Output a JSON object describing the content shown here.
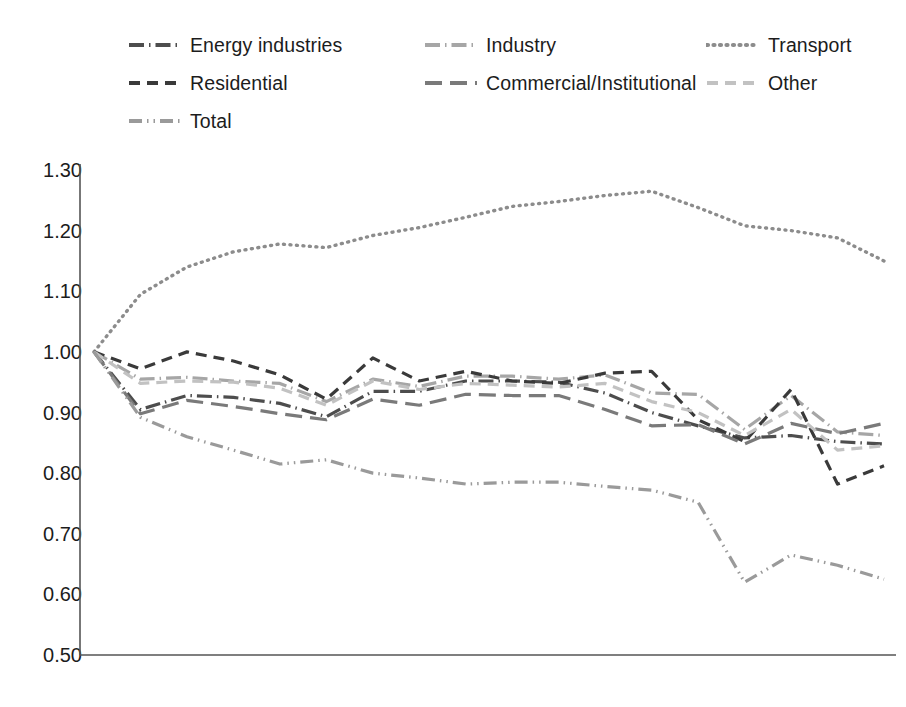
{
  "chart_data": {
    "type": "line",
    "title": "",
    "subtitle": "",
    "xlabel": "",
    "ylabel": "",
    "ylim": [
      0.5,
      1.3
    ],
    "ytick_step": 0.1,
    "ytick_labels": [
      "1.30",
      "1.20",
      "1.10",
      "1.00",
      "0.90",
      "0.80",
      "0.70",
      "0.60",
      "0.50"
    ],
    "ytick_values": [
      1.3,
      1.2,
      1.1,
      1.0,
      0.9,
      0.8,
      0.7,
      0.6,
      0.5
    ],
    "grid": false,
    "legend_position": "top",
    "categories": [
      "1990",
      "1995",
      "1997",
      "1998",
      "1999",
      "2000",
      "2001",
      "2002",
      "2003",
      "2004",
      "2005",
      "2006",
      "2007",
      "2008",
      "2009",
      "2010",
      "2011",
      "2012"
    ],
    "series": [
      {
        "name": "Energy industries",
        "color": "#4d4d4d",
        "dash": "dashdot",
        "values": [
          1.0,
          0.905,
          0.928,
          0.925,
          0.915,
          0.893,
          0.935,
          0.935,
          0.952,
          0.952,
          0.95,
          0.932,
          0.9,
          0.878,
          0.858,
          0.862,
          0.852,
          0.848
        ]
      },
      {
        "name": "Industry",
        "color": "#a6a6a6",
        "dash": "dashdot",
        "values": [
          1.0,
          0.955,
          0.958,
          0.952,
          0.948,
          0.918,
          0.955,
          0.943,
          0.96,
          0.96,
          0.955,
          0.962,
          0.932,
          0.93,
          0.872,
          0.928,
          0.868,
          0.862
        ]
      },
      {
        "name": "Transport",
        "color": "#8c8c8c",
        "dash": "dotted",
        "values": [
          1.0,
          1.095,
          1.14,
          1.165,
          1.178,
          1.172,
          1.192,
          1.205,
          1.222,
          1.24,
          1.248,
          1.258,
          1.265,
          1.238,
          1.208,
          1.2,
          1.188,
          1.15
        ]
      },
      {
        "name": "Residential",
        "color": "#3a3a3a",
        "dash": "dashed",
        "values": [
          1.0,
          0.972,
          1.0,
          0.985,
          0.962,
          0.922,
          0.99,
          0.952,
          0.968,
          0.952,
          0.948,
          0.965,
          0.968,
          0.888,
          0.852,
          0.938,
          0.782,
          0.812
        ]
      },
      {
        "name": "Commercial/Institutional",
        "color": "#7a7a7a",
        "dash": "longdash",
        "values": [
          1.0,
          0.898,
          0.92,
          0.91,
          0.898,
          0.888,
          0.922,
          0.912,
          0.93,
          0.928,
          0.928,
          0.905,
          0.878,
          0.88,
          0.848,
          0.882,
          0.865,
          0.882
        ]
      },
      {
        "name": "Other",
        "color": "#c2c2c2",
        "dash": "dashed",
        "values": [
          1.0,
          0.948,
          0.952,
          0.95,
          0.94,
          0.912,
          0.952,
          0.938,
          0.948,
          0.945,
          0.942,
          0.948,
          0.918,
          0.9,
          0.862,
          0.905,
          0.838,
          0.845
        ]
      },
      {
        "name": "Total",
        "color": "#9a9a9a",
        "dash": "dashdotdot",
        "values": [
          1.0,
          0.892,
          0.86,
          0.838,
          0.815,
          0.822,
          0.8,
          0.792,
          0.782,
          0.785,
          0.785,
          0.778,
          0.772,
          0.752,
          0.62,
          0.665,
          0.648,
          0.625
        ]
      }
    ]
  },
  "legend": {
    "rows": [
      [
        {
          "label": "Energy industries",
          "series": 0
        },
        {
          "label": "Industry",
          "series": 1
        },
        {
          "label": "Transport",
          "series": 2
        }
      ],
      [
        {
          "label": "Residential",
          "series": 3
        },
        {
          "label": "Commercial/Institutional",
          "series": 4
        },
        {
          "label": "Other",
          "series": 5
        }
      ],
      [
        {
          "label": "Total",
          "series": 6
        }
      ]
    ]
  }
}
